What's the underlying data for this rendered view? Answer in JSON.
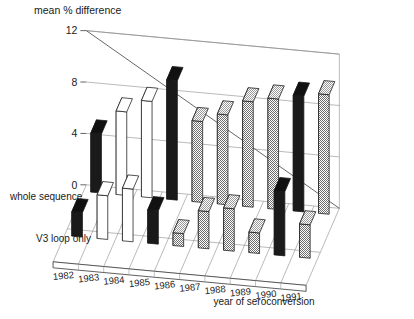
{
  "chart_data": {
    "type": "bar",
    "title": "mean % difference",
    "subtitle": "",
    "xlabel": "year of seroconversion",
    "ylabel": "mean % difference",
    "zlabel": "",
    "categories": [
      "1982",
      "1983",
      "1984",
      "1985",
      "1986",
      "1987",
      "1988",
      "1989",
      "1990",
      "1991"
    ],
    "yticks": [
      0,
      4,
      8,
      12
    ],
    "ylim": [
      0,
      12
    ],
    "grid": true,
    "legend_position": "left-axis-labels",
    "projection": "3d-bars",
    "row_labels": [
      "whole sequence",
      "V3 loop only"
    ],
    "series": [
      {
        "name": "whole sequence",
        "values": [
          4.6,
          6.5,
          7.5,
          9.3,
          6.3,
          7.0,
          8.2,
          8.6,
          9.0,
          9.3
        ],
        "fills": [
          "black",
          "white",
          "white",
          "black",
          "gray",
          "gray",
          "gray",
          "gray",
          "black",
          "gray"
        ]
      },
      {
        "name": "V3 loop only",
        "values": [
          1.9,
          3.4,
          4.1,
          2.6,
          1.0,
          2.9,
          3.3,
          1.6,
          5.0,
          2.6
        ],
        "fills": [
          "black",
          "white",
          "white",
          "black",
          "gray",
          "gray",
          "gray",
          "gray",
          "black",
          "gray"
        ]
      }
    ],
    "colors": {
      "black": "#1a1a1a",
      "white": "#ffffff",
      "gray": "#b0b0b0",
      "outline": "#1a1a1a",
      "grid": "#8c8c8c",
      "axis": "#555555"
    }
  }
}
